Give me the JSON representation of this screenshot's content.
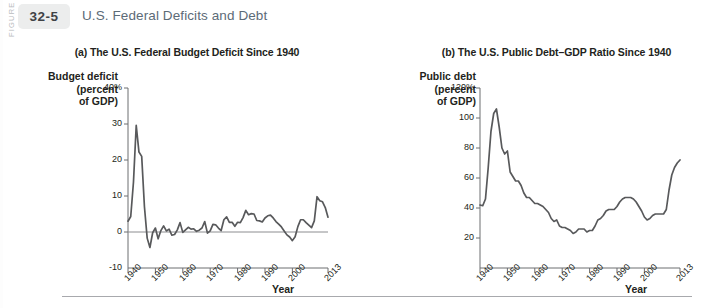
{
  "figure": {
    "side_label": "FIGURE",
    "number": "32-5",
    "title": "U.S. Federal Deficits and Debt",
    "badge_color": "#eceded",
    "title_color": "#5c6b77",
    "line_color": "#58595b"
  },
  "chart_data": [
    {
      "type": "line",
      "panel": "a",
      "title": "(a) The U.S. Federal Budget Deficit Since 1940",
      "ylabel": "Budget deficit\n(percent\nof GDP)",
      "xlabel": "Year",
      "ylim": [
        -10,
        40
      ],
      "yticks": [
        40,
        30,
        20,
        10,
        0,
        -10
      ],
      "ytick_labels": [
        "40%",
        "30",
        "20",
        "10",
        "0",
        "-10"
      ],
      "xlim": [
        1940,
        2013
      ],
      "xticks": [
        1940,
        1950,
        1960,
        1970,
        1980,
        1990,
        2000,
        2013
      ],
      "xtick_labels": [
        "1940",
        "1950",
        "1960",
        "1970",
        "1980",
        "1990",
        "2000",
        "2013"
      ],
      "grid": false,
      "legend": "none",
      "series": [
        {
          "name": "Federal budget deficit (percent of GDP)",
          "x": [
            1940,
            1941,
            1942,
            1943,
            1944,
            1945,
            1946,
            1947,
            1948,
            1949,
            1950,
            1951,
            1952,
            1953,
            1954,
            1955,
            1956,
            1957,
            1958,
            1959,
            1960,
            1961,
            1962,
            1963,
            1964,
            1965,
            1966,
            1967,
            1968,
            1969,
            1970,
            1971,
            1972,
            1973,
            1974,
            1975,
            1976,
            1977,
            1978,
            1979,
            1980,
            1981,
            1982,
            1983,
            1984,
            1985,
            1986,
            1987,
            1988,
            1989,
            1990,
            1991,
            1992,
            1993,
            1994,
            1995,
            1996,
            1997,
            1998,
            1999,
            2000,
            2001,
            2002,
            2003,
            2004,
            2005,
            2006,
            2007,
            2008,
            2009,
            2010,
            2011,
            2012,
            2013
          ],
          "values": [
            3.0,
            4.3,
            13.9,
            29.6,
            22.2,
            21.0,
            7.0,
            -1.7,
            -4.3,
            -0.2,
            1.1,
            -1.9,
            0.4,
            1.7,
            0.3,
            0.8,
            -0.9,
            -0.7,
            0.6,
            2.6,
            -0.1,
            0.6,
            1.3,
            0.8,
            0.9,
            0.2,
            0.5,
            1.1,
            2.9,
            -0.3,
            0.3,
            2.1,
            2.0,
            1.1,
            0.4,
            3.4,
            4.2,
            2.7,
            2.7,
            1.6,
            2.7,
            2.6,
            4.0,
            6.0,
            4.8,
            5.1,
            5.0,
            3.2,
            3.1,
            2.8,
            3.9,
            4.5,
            4.7,
            3.9,
            2.9,
            2.2,
            1.4,
            0.3,
            -0.8,
            -1.4,
            -2.4,
            -1.3,
            1.5,
            3.4,
            3.4,
            2.6,
            1.9,
            1.2,
            3.1,
            9.8,
            8.7,
            8.4,
            6.8,
            4.1
          ]
        }
      ]
    },
    {
      "type": "line",
      "panel": "b",
      "title": "(b) The U.S. Public Debt–GDP Ratio Since 1940",
      "ylabel": "Public debt\n(percent\nof GDP)",
      "xlabel": "Year",
      "ylim": [
        0,
        120
      ],
      "yticks": [
        120,
        100,
        80,
        60,
        40,
        20
      ],
      "ytick_labels": [
        "120%",
        "100",
        "80",
        "60",
        "40",
        "20"
      ],
      "xlim": [
        1940,
        2013
      ],
      "xticks": [
        1940,
        1950,
        1960,
        1970,
        1980,
        1990,
        2000,
        2013
      ],
      "xtick_labels": [
        "1940",
        "1950",
        "1960",
        "1970",
        "1980",
        "1990",
        "2000",
        "2013"
      ],
      "grid": false,
      "legend": "none",
      "series": [
        {
          "name": "U.S. public debt as percent of GDP",
          "x": [
            1940,
            1941,
            1942,
            1943,
            1944,
            1945,
            1946,
            1947,
            1948,
            1949,
            1950,
            1951,
            1952,
            1953,
            1954,
            1955,
            1956,
            1957,
            1958,
            1959,
            1960,
            1961,
            1962,
            1963,
            1964,
            1965,
            1966,
            1967,
            1968,
            1969,
            1970,
            1971,
            1972,
            1973,
            1974,
            1975,
            1976,
            1977,
            1978,
            1979,
            1980,
            1981,
            1982,
            1983,
            1984,
            1985,
            1986,
            1987,
            1988,
            1989,
            1990,
            1991,
            1992,
            1993,
            1994,
            1995,
            1996,
            1997,
            1998,
            1999,
            2000,
            2001,
            2002,
            2003,
            2004,
            2005,
            2006,
            2007,
            2008,
            2009,
            2010,
            2011,
            2012,
            2013
          ],
          "values": [
            42.0,
            41.5,
            46.0,
            67.0,
            91.0,
            103.0,
            106.0,
            94.0,
            80.0,
            76.0,
            78.0,
            64.0,
            61.0,
            58.0,
            58.0,
            55.0,
            50.0,
            47.0,
            47.0,
            45.0,
            43.0,
            43.0,
            42.0,
            41.0,
            39.0,
            37.0,
            33.0,
            31.0,
            32.0,
            28.0,
            27.0,
            27.0,
            26.0,
            25.0,
            23.0,
            24.0,
            26.0,
            26.0,
            26.0,
            24.0,
            25.0,
            25.0,
            28.0,
            32.0,
            33.0,
            35.0,
            38.0,
            39.0,
            39.0,
            39.0,
            41.0,
            44.0,
            46.0,
            47.0,
            47.0,
            47.0,
            46.0,
            44.0,
            41.0,
            38.0,
            34.0,
            32.0,
            33.0,
            35.0,
            36.0,
            36.0,
            36.0,
            36.0,
            39.0,
            52.0,
            62.0,
            67.0,
            70.0,
            72.0
          ]
        }
      ]
    }
  ]
}
